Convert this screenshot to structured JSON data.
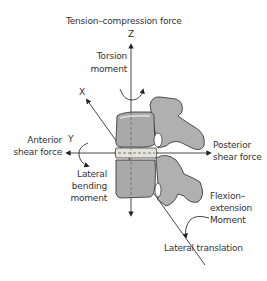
{
  "diagram": {
    "title": "Tension–compression force",
    "axes": {
      "z": "Z",
      "x": "X",
      "y": "Y"
    },
    "labels": {
      "torsion_line1": "Torsion",
      "torsion_line2": "moment",
      "anterior_line1": "Anterior",
      "anterior_line2": "shear force",
      "lateral_bending_line1": "Lateral",
      "lateral_bending_line2": "bending",
      "lateral_bending_line3": "moment",
      "posterior_line1": "Posterior",
      "posterior_line2": "shear force",
      "flexion_line1": "Flexion–",
      "flexion_line2": "extension",
      "flexion_line3": "Moment",
      "lateral_translation": "Lateral translation"
    },
    "colors": {
      "bone_fill": "#a9a9a9",
      "bone_light": "#d2d2d2",
      "disc": "#e4e4dc",
      "outline": "#2a2a2a",
      "text": "#333333"
    }
  }
}
